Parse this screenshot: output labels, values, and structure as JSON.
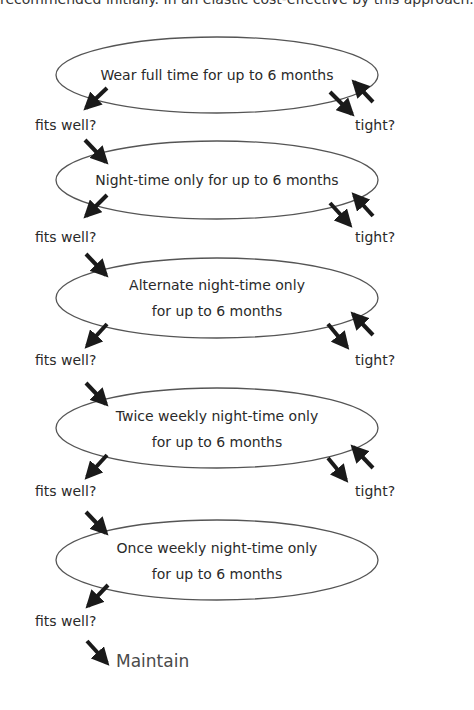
{
  "header": {
    "partial_text": "recommended initially. In an elastic cost-effective by this approach."
  },
  "stages": [
    {
      "lines": [
        "Wear full time for up to 6 months"
      ],
      "has_tight": true
    },
    {
      "lines": [
        "Night-time only for up to 6 months"
      ],
      "has_tight": true
    },
    {
      "lines": [
        "Alternate night-time only",
        "for up to 6 months"
      ],
      "has_tight": true
    },
    {
      "lines": [
        "Twice weekly night-time only",
        "for up to 6 months"
      ],
      "has_tight": true
    },
    {
      "lines": [
        "Once weekly night-time only",
        "for up to 6 months"
      ],
      "has_tight": false
    }
  ],
  "labels": {
    "fits_well": "fits well?",
    "tight": "tight?"
  },
  "outcome": {
    "label": "Maintain"
  },
  "colors": {
    "ellipse_stroke": "#555555",
    "arrow_fill": "#1a1a1a",
    "text": "#2a2a2a"
  }
}
